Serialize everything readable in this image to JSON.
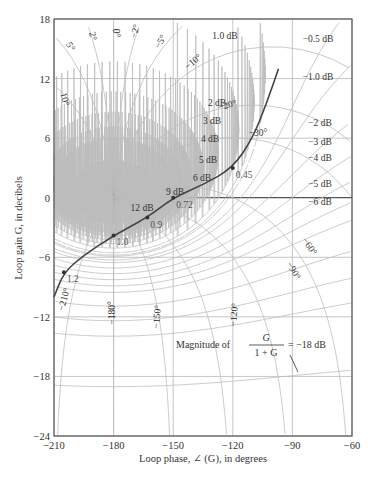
{
  "chart_data": {
    "type": "line",
    "subtype": "nichols-chart",
    "title": "",
    "xlabel": "Loop phase, ∠ (G), in degrees",
    "ylabel": "Loop gain G, in decibels",
    "xlim": [
      -210,
      -60
    ],
    "ylim": [
      -24,
      18
    ],
    "x_ticks": [
      -210,
      -180,
      -150,
      -120,
      -90,
      -60
    ],
    "y_ticks": [
      18,
      12,
      6,
      0,
      -6,
      -12,
      -18,
      -24
    ],
    "grid": true,
    "closed_loop_magnitude_contours_db": [
      12,
      9,
      6,
      5,
      4,
      3,
      2,
      1.0,
      0.5,
      -0.5,
      -1.0,
      -2,
      -3,
      -4,
      -5,
      -6,
      -18
    ],
    "closed_loop_magnitude_labels": [
      "1.0 dB",
      "2 dB",
      "3 dB",
      "4 dB",
      "5 dB",
      "6 dB",
      "9 dB",
      "12 dB",
      "−0.5 dB",
      "−1.0 dB",
      "−2 dB",
      "−3 dB",
      "−4 dB",
      "−5 dB",
      "−6 dB"
    ],
    "closed_loop_phase_contours_deg": [
      5,
      2,
      0,
      -2,
      -5,
      -10,
      -20,
      -30,
      -60,
      -90,
      -120,
      -150,
      -180,
      -210
    ],
    "closed_loop_phase_labels": [
      "5°",
      "2°",
      "0°",
      "−2°",
      "−5°",
      "−10°",
      "−20°",
      "−30°",
      "−60°",
      "−90°",
      "−120°",
      "−150°",
      "−180°",
      "−210°",
      "10°"
    ],
    "annotation": {
      "text": "Magnitude of",
      "fraction_num": "G",
      "fraction_den": "1 + G",
      "value": "= −18 dB"
    },
    "series": [
      {
        "name": "Open-loop frequency response G(jω)",
        "x": [
          -210,
          -205,
          -195,
          -180,
          -163,
          -150,
          -135,
          -120,
          -110,
          -103,
          -97
        ],
        "y": [
          -10,
          -7.5,
          -5.8,
          -3.8,
          -2.0,
          0,
          1.3,
          3.0,
          6.0,
          9.5,
          13.0
        ],
        "frequency_markers": [
          {
            "label": "0.45",
            "x": -120,
            "y": 3.0
          },
          {
            "label": "0.72",
            "x": -150,
            "y": 0
          },
          {
            "label": "0.9",
            "x": -163,
            "y": -2.0
          },
          {
            "label": "1.0",
            "x": -180,
            "y": -3.8
          },
          {
            "label": "1.2",
            "x": -205,
            "y": -7.5
          }
        ]
      }
    ]
  },
  "labels": {
    "x_ticks": [
      "−210",
      "−180",
      "−150",
      "−120",
      "−90",
      "−60"
    ],
    "y_ticks": [
      "18",
      "12",
      "6",
      "0",
      "−6",
      "−12",
      "−18",
      "−24"
    ]
  }
}
